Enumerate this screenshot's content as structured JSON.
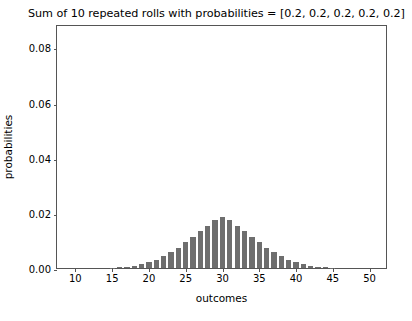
{
  "chart_data": {
    "type": "bar",
    "title": "Sum of 10 repeated rolls with probabilities = [0.2, 0.2, 0.2, 0.2, 0.2]",
    "xlabel": "outcomes",
    "ylabel": "probabilities",
    "xlim": [
      7.5,
      52.5
    ],
    "ylim": [
      0.0,
      0.0885
    ],
    "grid": false,
    "legend": null,
    "xticks": [
      10,
      15,
      20,
      25,
      30,
      35,
      40,
      45,
      50
    ],
    "xtick_labels": [
      "10",
      "15",
      "20",
      "25",
      "30",
      "35",
      "40",
      "45",
      "50"
    ],
    "yticks": [
      0.0,
      0.02,
      0.04,
      0.06,
      0.08
    ],
    "ytick_labels": [
      "0.00",
      "0.02",
      "0.04",
      "0.06",
      "0.08"
    ],
    "bar_color": "#6e6e6e",
    "bar_width": 0.72,
    "categories": [
      10,
      11,
      12,
      13,
      14,
      15,
      16,
      17,
      18,
      19,
      20,
      21,
      22,
      23,
      24,
      25,
      26,
      27,
      28,
      29,
      30,
      31,
      32,
      33,
      34,
      35,
      36,
      37,
      38,
      39,
      40,
      41,
      42,
      43,
      44,
      45,
      46,
      47,
      48,
      49,
      50
    ],
    "values": [
      1e-07,
      1e-06,
      5.5e-06,
      2e-05,
      5.63e-05,
      0.0001301,
      0.0002622,
      0.0004787,
      0.0008173,
      0.0013254,
      0.0020467,
      0.0030132,
      0.0042401,
      0.0057214,
      0.0074303,
      0.0093198,
      0.0113271,
      0.0133772,
      0.0153893,
      0.017283,
      0.0184442,
      0.017283,
      0.0153893,
      0.0133772,
      0.0113271,
      0.0093198,
      0.0074303,
      0.0057214,
      0.0042401,
      0.0030132,
      0.0020467,
      0.0013254,
      0.0008173,
      0.0004787,
      0.0002622,
      0.0001301,
      5.63e-05,
      2e-05,
      5.5e-06,
      1e-06,
      1e-07
    ]
  }
}
